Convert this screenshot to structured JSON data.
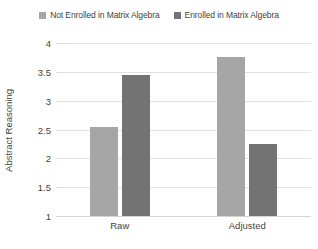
{
  "chart_data": {
    "type": "bar",
    "title": "",
    "subtitle": "",
    "xlabel": "",
    "ylabel": "Abstract Reasoning",
    "categories": [
      "Raw",
      "Adjusted"
    ],
    "series": [
      {
        "name": "Not Enrolled in Matrix Algebra",
        "color": "#a6a6a6",
        "values": [
          2.55,
          3.75
        ]
      },
      {
        "name": "Enrolled in Matrix Algebra",
        "color": "#737373",
        "values": [
          3.44,
          2.25
        ]
      }
    ],
    "ylim": [
      1,
      4
    ],
    "ytick_step": 0.5,
    "ytick_labels": [
      "4",
      "3.5",
      "3",
      "2.5",
      "2",
      "1.5",
      "1"
    ],
    "grid": true,
    "legend_position": "top-center",
    "annotations": []
  },
  "legend": {
    "entries": [
      {
        "label": "Not Enrolled in Matrix Algebra",
        "swatch_icon": "square-swatch-light"
      },
      {
        "label": "Enrolled in Matrix Algebra",
        "swatch_icon": "square-swatch-dark"
      }
    ]
  },
  "colors": {
    "series_light": "#a6a6a6",
    "series_dark": "#737373",
    "gridline": "#e2e2e2",
    "baseline": "#d4d4d4",
    "text": "#3f3f3f",
    "background": "#ffffff"
  }
}
